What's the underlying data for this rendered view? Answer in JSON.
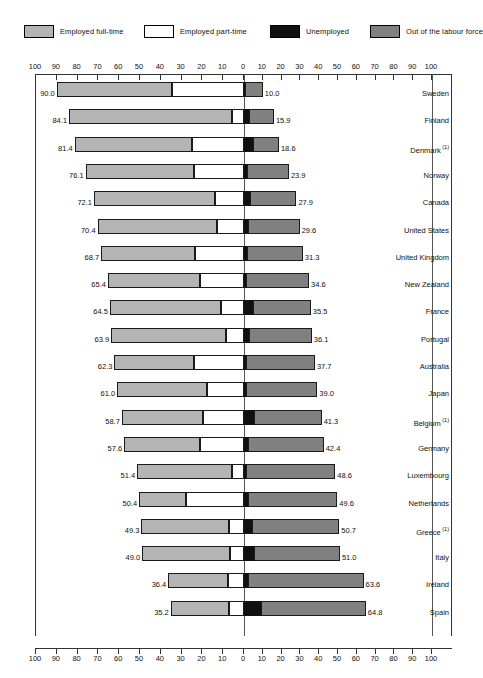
{
  "legend": {
    "items": [
      {
        "label": "Employed full-time",
        "key": "ft",
        "color": "#b4b4b4",
        "icon": "legend-swatch-full-time"
      },
      {
        "label": "Employed part-time",
        "key": "pt",
        "color": "#ffffff",
        "icon": "legend-swatch-part-time"
      },
      {
        "label": "Unemployed",
        "key": "un",
        "color": "#101010",
        "icon": "legend-swatch-unemployed"
      },
      {
        "label": "Out of the labour force",
        "key": "olf",
        "color": "#808080",
        "icon": "legend-swatch-out-of-labour-force"
      }
    ]
  },
  "axis": {
    "ticks": [
      100,
      90,
      80,
      70,
      60,
      50,
      40,
      30,
      20,
      10,
      0,
      10,
      20,
      30,
      40,
      50,
      60,
      70,
      80,
      90,
      100
    ],
    "left_max": 100,
    "right_max": 100,
    "zero_label": "0"
  },
  "chart_data": {
    "type": "bar",
    "title": "",
    "subtitle": "",
    "xlabel": "",
    "ylabel": "",
    "orientation": "horizontal-diverging-stacked",
    "grid": false,
    "legend_position": "top",
    "xlim": [
      -100,
      100
    ],
    "axis_ticks": [
      100,
      90,
      80,
      70,
      60,
      50,
      40,
      30,
      20,
      10,
      0,
      10,
      20,
      30,
      40,
      50,
      60,
      70,
      80,
      90,
      100
    ],
    "categories": [
      "Sweden",
      "Finland",
      "Denmark",
      "Norway",
      "Canada",
      "United States",
      "United Kingdom",
      "New Zealand",
      "France",
      "Portugal",
      "Australia",
      "Japan",
      "Belgium",
      "Germany",
      "Luxembourg",
      "Netherlands",
      "Greece",
      "Italy",
      "Ireland",
      "Spain"
    ],
    "series": [
      {
        "name": "Employed full-time",
        "side": "left",
        "color": "#b4b4b4",
        "values": [
          55.4,
          78.4,
          56.4,
          52.0,
          58.1,
          57.4,
          45.2,
          44.1,
          53.5,
          55.4,
          38.2,
          43.2,
          39.2,
          36.5,
          45.4,
          22.6,
          42.3,
          42.4,
          28.5,
          28.2
        ]
      },
      {
        "name": "Employed part-time",
        "side": "left",
        "color": "#ffffff",
        "values": [
          34.6,
          5.7,
          25.0,
          24.1,
          14.0,
          13.0,
          23.5,
          21.3,
          11.0,
          8.5,
          24.1,
          17.8,
          19.5,
          21.1,
          6.0,
          27.8,
          7.0,
          6.6,
          7.9,
          7.0
        ]
      },
      {
        "name": "Unemployed",
        "side": "right",
        "color": "#101010",
        "values": [
          0.3,
          2.6,
          5.0,
          1.8,
          3.0,
          2.2,
          1.7,
          1.3,
          5.0,
          2.9,
          1.2,
          0.8,
          5.1,
          1.9,
          1.3,
          2.2,
          4.5,
          5.2,
          2.1,
          9.1
        ]
      },
      {
        "name": "Out of the labour force",
        "side": "right",
        "color": "#808080",
        "values": [
          9.7,
          13.3,
          13.6,
          22.1,
          24.9,
          27.4,
          29.6,
          33.3,
          30.5,
          33.2,
          36.5,
          38.2,
          36.2,
          40.5,
          47.3,
          47.4,
          46.2,
          45.8,
          61.5,
          55.7
        ]
      }
    ],
    "left_totals": [
      90.0,
      84.1,
      81.4,
      76.1,
      72.1,
      70.4,
      68.7,
      65.4,
      64.5,
      63.9,
      62.3,
      61.0,
      58.7,
      57.6,
      51.4,
      50.4,
      49.3,
      49.0,
      36.4,
      35.2
    ],
    "right_totals": [
      10.0,
      15.9,
      18.6,
      23.9,
      27.9,
      29.6,
      31.3,
      34.6,
      35.5,
      36.1,
      37.7,
      39.0,
      41.3,
      42.4,
      48.6,
      49.6,
      50.7,
      51.0,
      63.6,
      64.8
    ]
  },
  "rows": [
    {
      "country": "Sweden",
      "footnote": "",
      "left_value": "90.0",
      "right_value": "10.0",
      "ft": 55.4,
      "pt": 34.6,
      "un": 0.3,
      "olf": 9.7
    },
    {
      "country": "Finland",
      "footnote": "",
      "left_value": "84.1",
      "right_value": "15.9",
      "ft": 78.4,
      "pt": 5.7,
      "un": 2.6,
      "olf": 13.3
    },
    {
      "country": "Denmark",
      "footnote": "(1)",
      "left_value": "81.4",
      "right_value": "18.6",
      "ft": 56.4,
      "pt": 25.0,
      "un": 5.0,
      "olf": 13.6
    },
    {
      "country": "Norway",
      "footnote": "",
      "left_value": "76.1",
      "right_value": "23.9",
      "ft": 52.0,
      "pt": 24.1,
      "un": 1.8,
      "olf": 22.1
    },
    {
      "country": "Canada",
      "footnote": "",
      "left_value": "72.1",
      "right_value": "27.9",
      "ft": 58.1,
      "pt": 14.0,
      "un": 3.0,
      "olf": 24.9
    },
    {
      "country": "United States",
      "footnote": "",
      "left_value": "70.4",
      "right_value": "29.6",
      "ft": 57.4,
      "pt": 13.0,
      "un": 2.2,
      "olf": 27.4
    },
    {
      "country": "United Kingdom",
      "footnote": "",
      "left_value": "68.7",
      "right_value": "31.3",
      "ft": 45.2,
      "pt": 23.5,
      "un": 1.7,
      "olf": 29.6
    },
    {
      "country": "New Zealand",
      "footnote": "",
      "left_value": "65.4",
      "right_value": "34.6",
      "ft": 44.1,
      "pt": 21.3,
      "un": 1.3,
      "olf": 33.3
    },
    {
      "country": "France",
      "footnote": "",
      "left_value": "64.5",
      "right_value": "35.5",
      "ft": 53.5,
      "pt": 11.0,
      "un": 5.0,
      "olf": 30.5
    },
    {
      "country": "Portugal",
      "footnote": "",
      "left_value": "63.9",
      "right_value": "36.1",
      "ft": 55.4,
      "pt": 8.5,
      "un": 2.9,
      "olf": 33.2
    },
    {
      "country": "Australia",
      "footnote": "",
      "left_value": "62.3",
      "right_value": "37.7",
      "ft": 38.2,
      "pt": 24.1,
      "un": 1.2,
      "olf": 36.5
    },
    {
      "country": "Japan",
      "footnote": "",
      "left_value": "61.0",
      "right_value": "39.0",
      "ft": 43.2,
      "pt": 17.8,
      "un": 0.8,
      "olf": 38.2
    },
    {
      "country": "Belgium",
      "footnote": "(1)",
      "left_value": "58.7",
      "right_value": "41.3",
      "ft": 39.2,
      "pt": 19.5,
      "un": 5.1,
      "olf": 36.2
    },
    {
      "country": "Germany",
      "footnote": "",
      "left_value": "57.6",
      "right_value": "42.4",
      "ft": 36.5,
      "pt": 21.1,
      "un": 1.9,
      "olf": 40.5
    },
    {
      "country": "Luxembourg",
      "footnote": "",
      "left_value": "51.4",
      "right_value": "48.6",
      "ft": 45.4,
      "pt": 6.0,
      "un": 1.3,
      "olf": 47.3
    },
    {
      "country": "Netherlands",
      "footnote": "",
      "left_value": "50.4",
      "right_value": "49.6",
      "ft": 22.6,
      "pt": 27.8,
      "un": 2.2,
      "olf": 47.4
    },
    {
      "country": "Greece",
      "footnote": "(1)",
      "left_value": "49.3",
      "right_value": "50.7",
      "ft": 42.3,
      "pt": 7.0,
      "un": 4.5,
      "olf": 46.2
    },
    {
      "country": "Italy",
      "footnote": "",
      "left_value": "49.0",
      "right_value": "51.0",
      "ft": 42.4,
      "pt": 6.6,
      "un": 5.2,
      "olf": 45.8
    },
    {
      "country": "Ireland",
      "footnote": "",
      "left_value": "36.4",
      "right_value": "63.6",
      "ft": 28.5,
      "pt": 7.9,
      "un": 2.1,
      "olf": 61.5
    },
    {
      "country": "Spain",
      "footnote": "",
      "left_value": "35.2",
      "right_value": "64.8",
      "ft": 28.2,
      "pt": 7.0,
      "un": 9.1,
      "olf": 55.7
    }
  ]
}
